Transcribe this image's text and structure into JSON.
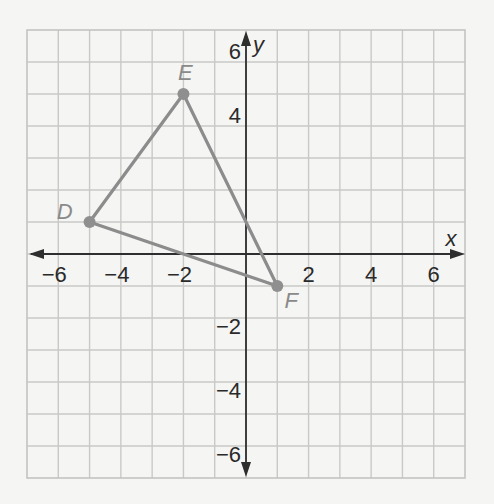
{
  "chart_data": {
    "type": "scatter",
    "title": "",
    "xlabel": "x",
    "ylabel": "y",
    "xlim": [
      -7,
      7
    ],
    "ylim": [
      -7,
      7
    ],
    "grid": true,
    "x_ticks": [
      -6,
      -4,
      -2,
      2,
      4,
      6
    ],
    "y_ticks": [
      6,
      4,
      -2,
      -4,
      -6
    ],
    "x_tick_labels": [
      "−6",
      "−4",
      "−2",
      "2",
      "4",
      "6"
    ],
    "y_tick_labels": [
      "6",
      "4",
      "−2",
      "−4",
      "−6"
    ],
    "points": [
      {
        "label": "D",
        "x": -5,
        "y": 1
      },
      {
        "label": "E",
        "x": -2,
        "y": 5
      },
      {
        "label": "F",
        "x": 1,
        "y": -1
      }
    ],
    "polygon": {
      "name": "triangle DEF",
      "vertices": [
        "D",
        "E",
        "F"
      ]
    },
    "colors": {
      "background": "#f5f5f3",
      "grid": "#c9c9c7",
      "axis": "#2e2e2e",
      "triangle": "#8c8c8c",
      "vertex_label": "#8a8a8a"
    }
  },
  "labels": {
    "x_axis": "x",
    "y_axis": "y",
    "D": "D",
    "E": "E",
    "F": "F"
  }
}
